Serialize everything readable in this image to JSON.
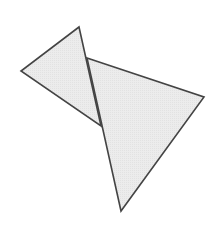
{
  "diagram": {
    "width": 222,
    "height": 225,
    "background": "#ffffff",
    "fill": "#ebebeb",
    "stroke": "#444444",
    "stroke_width": 1.6,
    "shapes": [
      {
        "name": "left-triangle",
        "points": "79,27 21,71 101,126"
      },
      {
        "name": "right-triangle",
        "points": "87,58 204,97 121,211"
      }
    ]
  }
}
